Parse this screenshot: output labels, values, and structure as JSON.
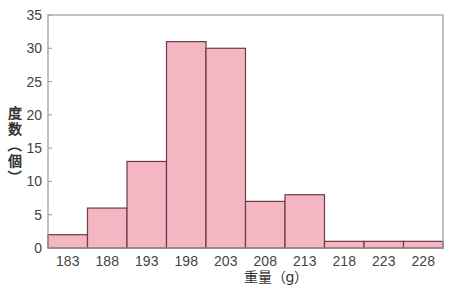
{
  "chart_data": {
    "type": "bar",
    "title": "",
    "xlabel": "重量（g）",
    "ylabel": "度数（個）",
    "categories": [
      "183",
      "188",
      "193",
      "198",
      "203",
      "208",
      "213",
      "218",
      "223",
      "228"
    ],
    "values": [
      2,
      6,
      13,
      31,
      30,
      7,
      8,
      1,
      1,
      1
    ],
    "ylim": [
      0,
      35
    ],
    "yticks": [
      0,
      5,
      10,
      15,
      20,
      25,
      30,
      35
    ],
    "grid": false,
    "legend": null,
    "colors": {
      "bar_fill": "#f4b6c2",
      "bar_edge": "#6b3a44",
      "axis": "#999999"
    }
  }
}
